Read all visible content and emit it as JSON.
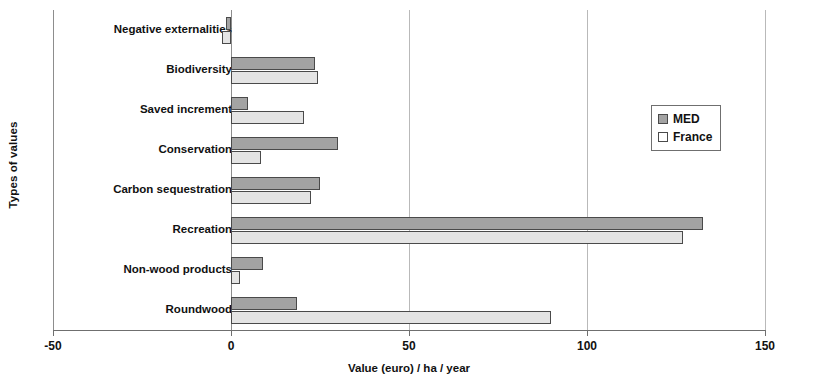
{
  "chart_data": {
    "type": "bar",
    "orientation": "horizontal",
    "title": "",
    "xlabel": "Value (euro) / ha / year",
    "ylabel": "Types of values",
    "xlim": [
      -50,
      150
    ],
    "xticks": [
      -50,
      0,
      50,
      100,
      150
    ],
    "xtick_labels": [
      "-50",
      "0",
      "50",
      "100",
      "150"
    ],
    "grid": true,
    "legend_position": "right-top",
    "categories": [
      "Negative externalities",
      "Biodiversity",
      "Saved increment",
      "Conservation",
      "Carbon sequestration",
      "Recreation",
      "Non-wood products",
      "Roundwood"
    ],
    "series": [
      {
        "name": "MED",
        "color": "#a3a3a3",
        "values": [
          -1.5,
          23.5,
          4.8,
          30,
          25,
          132.5,
          9,
          18.5
        ]
      },
      {
        "name": "France",
        "color": "#e4e4e4",
        "values": [
          -2.5,
          24.5,
          20.5,
          8.5,
          22.5,
          127,
          2.5,
          90
        ]
      }
    ]
  },
  "legend": {
    "items": [
      {
        "label": "MED",
        "swatch": "med"
      },
      {
        "label": "France",
        "swatch": "france"
      }
    ]
  }
}
